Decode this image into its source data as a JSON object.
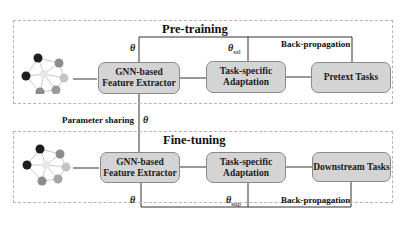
{
  "diagram": {
    "pretraining": {
      "title": "Pre-training",
      "encoder_label_line1": "GNN-based",
      "encoder_label_line2": "Feature Extractor",
      "adaptation_label_line1": "Task-specific",
      "adaptation_label_line2": "Adaptation",
      "task_label": "Pretext Tasks",
      "theta": "θ",
      "theta_ssl_symbol": "θ",
      "theta_ssl_sub": "ssl",
      "backprop_label": "Back-propagation"
    },
    "sharing": {
      "label": "Parameter sharing",
      "theta": "θ"
    },
    "finetuning": {
      "title": "Fine-tuning",
      "encoder_label_line1": "GNN-based",
      "encoder_label_line2": "Feature Extractor",
      "adaptation_label_line1": "Task-specific",
      "adaptation_label_line2": "Adaptation",
      "task_label": "Downstream Tasks",
      "theta": "θ",
      "theta_sup_symbol": "θ",
      "theta_sup_sub": "sup",
      "backprop_label": "Back-propagation"
    },
    "colors": {
      "box_fill": "#d4d4d4",
      "box_border": "#8a8a8a",
      "line": "#333333",
      "panel_border": "#b5b5b5",
      "node_dark": "#1e1e1e",
      "node_mid": "#8c8c8c",
      "node_light": "#c4c4c4",
      "node_center": "#e6e6e6"
    }
  }
}
